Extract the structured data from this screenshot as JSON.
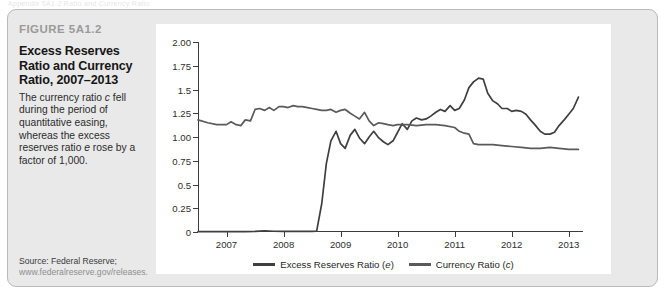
{
  "page": {
    "bleed_text": "Appendix 5A1.2 Ratio and Currency Ratio"
  },
  "figure": {
    "kicker": "FIGURE 5A1.2",
    "title": "Excess Reserves Ratio and Currency Ratio, 2007–2013",
    "description_parts": {
      "p1": "The currency ratio ",
      "i1": "c",
      "p2": " fell during the period of quantitative easing, whereas the excess reserves ratio ",
      "i2": "e",
      "p3": " rose by a factor of 1,000."
    },
    "source_label": "Source: Federal Reserve;",
    "source_url": "www.federalreserve.gov/releases."
  },
  "colors": {
    "card_background": "#e9e9e9",
    "card_border": "#b9b9b9",
    "panel_background": "#ffffff",
    "axis": "#3c3c3c",
    "series_excess_reserves": "#3f3f3f",
    "series_currency": "#5a5a5a",
    "kicker_text": "#9a9a9a",
    "title_text": "#161616"
  },
  "chart_data": {
    "type": "line",
    "title": "Excess Reserves Ratio and Currency Ratio, 2007–2013",
    "xlabel": "",
    "ylabel": "",
    "xlim": [
      2006.5,
      2013.25
    ],
    "ylim": [
      0,
      2.0
    ],
    "grid": false,
    "legend_position": "bottom-center",
    "ytick_labels": [
      "0",
      "0.25",
      "0.5",
      "0.75",
      "1.00",
      "1.25",
      "1.5",
      "1.75",
      "2.00"
    ],
    "ytick_values": [
      0,
      0.25,
      0.5,
      0.75,
      1.0,
      1.25,
      1.5,
      1.75,
      2.0
    ],
    "xtick_labels": [
      "2007",
      "2008",
      "2009",
      "2010",
      "2011",
      "2012",
      "2013"
    ],
    "xtick_values": [
      2007,
      2008,
      2009,
      2010,
      2011,
      2012,
      2013
    ],
    "series": [
      {
        "name": "Excess Reserves Ratio (e)",
        "legend_label_text": "Excess Reserves Ratio (",
        "legend_label_italic": "e",
        "legend_label_tail": ")",
        "color": "#3f3f3f",
        "x": [
          2006.5,
          2006.67,
          2006.83,
          2007.0,
          2007.17,
          2007.33,
          2007.5,
          2007.67,
          2007.83,
          2008.0,
          2008.17,
          2008.33,
          2008.5,
          2008.58,
          2008.67,
          2008.75,
          2008.83,
          2008.92,
          2009.0,
          2009.08,
          2009.17,
          2009.25,
          2009.33,
          2009.42,
          2009.5,
          2009.58,
          2009.67,
          2009.75,
          2009.83,
          2009.92,
          2010.0,
          2010.08,
          2010.17,
          2010.25,
          2010.33,
          2010.42,
          2010.5,
          2010.58,
          2010.67,
          2010.75,
          2010.83,
          2010.92,
          2011.0,
          2011.08,
          2011.17,
          2011.25,
          2011.33,
          2011.42,
          2011.5,
          2011.58,
          2011.67,
          2011.75,
          2011.83,
          2011.92,
          2012.0,
          2012.08,
          2012.17,
          2012.25,
          2012.33,
          2012.42,
          2012.5,
          2012.58,
          2012.67,
          2012.75,
          2012.83,
          2012.92,
          2013.0,
          2013.08,
          2013.17
        ],
        "y": [
          0.004,
          0.004,
          0.004,
          0.005,
          0.005,
          0.004,
          0.006,
          0.012,
          0.008,
          0.006,
          0.006,
          0.006,
          0.007,
          0.01,
          0.3,
          0.72,
          0.96,
          1.06,
          0.93,
          0.88,
          1.02,
          1.08,
          0.99,
          0.93,
          1.0,
          1.06,
          0.99,
          0.95,
          0.92,
          0.96,
          1.05,
          1.14,
          1.08,
          1.17,
          1.2,
          1.18,
          1.19,
          1.22,
          1.26,
          1.29,
          1.27,
          1.33,
          1.28,
          1.3,
          1.39,
          1.52,
          1.58,
          1.62,
          1.61,
          1.46,
          1.38,
          1.35,
          1.3,
          1.3,
          1.27,
          1.28,
          1.27,
          1.24,
          1.18,
          1.12,
          1.06,
          1.03,
          1.03,
          1.05,
          1.12,
          1.18,
          1.24,
          1.3,
          1.42
        ]
      },
      {
        "name": "Currency Ratio (c)",
        "legend_label_text": "Currency Ratio (",
        "legend_label_italic": "c",
        "legend_label_tail": ")",
        "color": "#5a5a5a",
        "x": [
          2006.5,
          2006.67,
          2006.83,
          2007.0,
          2007.08,
          2007.17,
          2007.25,
          2007.33,
          2007.42,
          2007.5,
          2007.58,
          2007.67,
          2007.75,
          2007.83,
          2007.92,
          2008.0,
          2008.08,
          2008.17,
          2008.25,
          2008.33,
          2008.42,
          2008.5,
          2008.58,
          2008.67,
          2008.75,
          2008.83,
          2008.92,
          2009.0,
          2009.08,
          2009.17,
          2009.25,
          2009.33,
          2009.42,
          2009.5,
          2009.58,
          2009.67,
          2009.75,
          2009.83,
          2009.92,
          2010.0,
          2010.17,
          2010.33,
          2010.5,
          2010.67,
          2010.83,
          2011.0,
          2011.08,
          2011.17,
          2011.25,
          2011.33,
          2011.42,
          2011.5,
          2011.67,
          2011.83,
          2012.0,
          2012.17,
          2012.33,
          2012.5,
          2012.67,
          2012.83,
          2013.0,
          2013.17
        ],
        "y": [
          1.18,
          1.15,
          1.13,
          1.13,
          1.16,
          1.13,
          1.12,
          1.18,
          1.17,
          1.29,
          1.3,
          1.28,
          1.31,
          1.28,
          1.32,
          1.32,
          1.31,
          1.33,
          1.32,
          1.32,
          1.31,
          1.3,
          1.29,
          1.28,
          1.28,
          1.29,
          1.26,
          1.28,
          1.29,
          1.25,
          1.22,
          1.19,
          1.26,
          1.17,
          1.12,
          1.15,
          1.14,
          1.13,
          1.12,
          1.13,
          1.13,
          1.12,
          1.13,
          1.13,
          1.12,
          1.1,
          1.06,
          1.04,
          1.03,
          0.93,
          0.92,
          0.92,
          0.92,
          0.91,
          0.9,
          0.89,
          0.88,
          0.88,
          0.89,
          0.88,
          0.87,
          0.87
        ]
      }
    ]
  }
}
